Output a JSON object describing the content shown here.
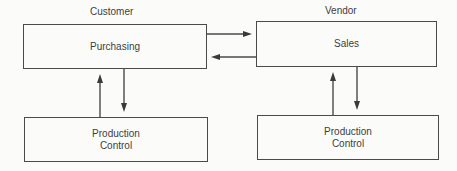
{
  "diagram": {
    "customer": {
      "header": "Customer",
      "main_box": "Purchasing",
      "sub_box_line1": "Production",
      "sub_box_line2": "Control"
    },
    "vendor": {
      "header": "Vendor",
      "main_box": "Sales",
      "sub_box_line1": "Production",
      "sub_box_line2": "Control"
    },
    "connections": [
      {
        "from": "Purchasing",
        "to": "Sales",
        "direction": "right"
      },
      {
        "from": "Sales",
        "to": "Purchasing",
        "direction": "left"
      },
      {
        "from": "Purchasing",
        "to": "Customer Production Control",
        "direction": "down"
      },
      {
        "from": "Customer Production Control",
        "to": "Purchasing",
        "direction": "up"
      },
      {
        "from": "Sales",
        "to": "Vendor Production Control",
        "direction": "down"
      },
      {
        "from": "Vendor Production Control",
        "to": "Sales",
        "direction": "up"
      }
    ],
    "colors": {
      "line": "#4a4a4a",
      "text": "#3e3e3e",
      "background": "#fbfbf9"
    }
  }
}
